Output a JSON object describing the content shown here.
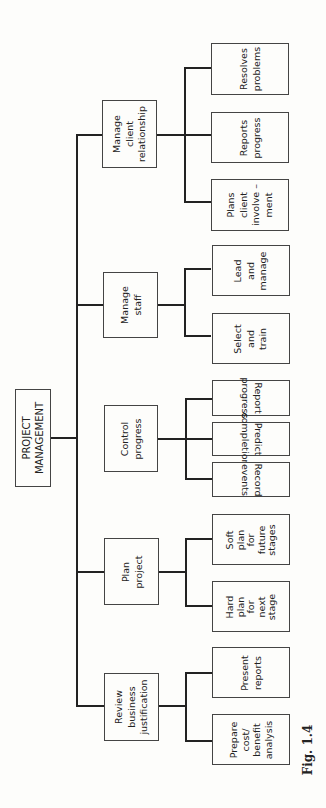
{
  "root": {
    "label": "PROJECT\nMANAGEMENT"
  },
  "branches": [
    {
      "label": "Manage\nclient\nrelationship",
      "children": [
        "Resolves\nproblems",
        "Reports\nprogress",
        "Plans\nclient\ninvolve –\nment"
      ]
    },
    {
      "label": "Manage\nstaff",
      "children": [
        "Lead\nand\nmanage",
        "Select\nand\ntrain"
      ]
    },
    {
      "label": "Control\nprogress",
      "children": [
        "Report\nprogress",
        "Predict\ncompletion",
        "Record\nevents"
      ]
    },
    {
      "label": "Plan\nproject",
      "children": [
        "Soft\nplan\nfor\nfuture\nstages",
        "Hard\nplan\nfor\nnext\nstage"
      ]
    },
    {
      "label": "Review\nbusiness\njustification",
      "children": [
        "Present\nreports",
        "Prepare\ncost/\nbenefit\nanalysis"
      ]
    }
  ],
  "caption": "Fig. 1.4"
}
